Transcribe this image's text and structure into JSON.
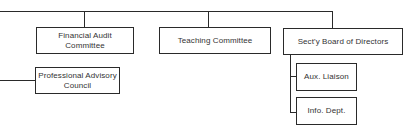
{
  "org_chart": {
    "nodes": [
      {
        "id": "financial-audit",
        "label_line1": "Financial Audit",
        "label_line2": "Committee"
      },
      {
        "id": "teaching",
        "label": "Teaching Committee"
      },
      {
        "id": "secty-board",
        "label": "Sect'y Board of Directors"
      },
      {
        "id": "professional-advisory",
        "label_line1": "Professional Advisory",
        "label_line2": "Council"
      },
      {
        "id": "aux-liaison",
        "label": "Aux. Liaison"
      },
      {
        "id": "info-dept",
        "label": "Info. Dept."
      }
    ],
    "edges": [
      {
        "from": "top-bus",
        "to": "financial-audit"
      },
      {
        "from": "top-bus",
        "to": "teaching"
      },
      {
        "from": "top-bus",
        "to": "secty-board"
      },
      {
        "from": "left-bus",
        "to": "professional-advisory"
      },
      {
        "from": "secty-board",
        "to": "aux-liaison"
      },
      {
        "from": "secty-board",
        "to": "info-dept"
      }
    ]
  }
}
